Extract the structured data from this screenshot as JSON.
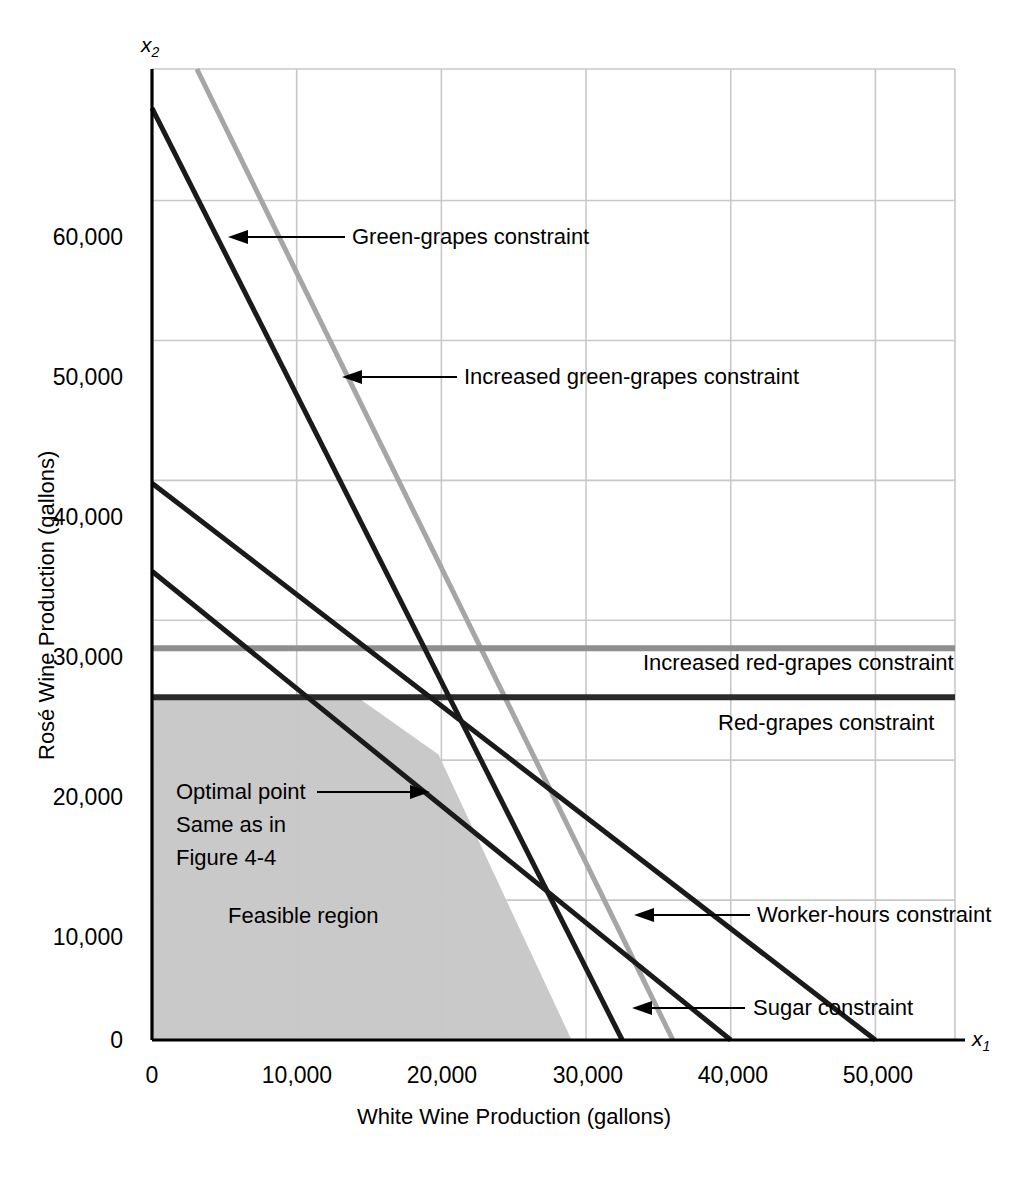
{
  "chart_data": {
    "type": "line",
    "title": "",
    "xlabel": "White Wine Production (gallons)",
    "ylabel": "Rosé Wine Production (gallons)",
    "x_axis_symbol": "x",
    "x_axis_subscript": "1",
    "y_axis_symbol": "x",
    "y_axis_subscript": "2",
    "xlim": [
      0,
      55500
    ],
    "ylim": [
      0,
      69400
    ],
    "xticks": [
      0,
      10000,
      20000,
      30000,
      40000,
      50000
    ],
    "xticklabels": [
      "0",
      "10,000",
      "20,000",
      "30,000",
      "40,000",
      "50,000"
    ],
    "yticks": [
      0,
      10000,
      20000,
      30000,
      40000,
      50000,
      60000
    ],
    "yticklabels": [
      "0",
      "10,000",
      "20,000",
      "30,000",
      "40,000",
      "50,000",
      "60,000"
    ],
    "grid": true,
    "grid_color": "#c8c8c8",
    "legend_position": "none",
    "series": [
      {
        "name": "Green-grapes constraint",
        "style": "solid-dark",
        "color": "#1a1a1a",
        "width": 5,
        "points": [
          [
            0,
            66600
          ],
          [
            32500,
            0
          ]
        ]
      },
      {
        "name": "Increased green-grapes constraint",
        "style": "solid-gray",
        "color": "#a6a6a6",
        "width": 5,
        "points": [
          [
            3100,
            69400
          ],
          [
            36000,
            0
          ]
        ]
      },
      {
        "name": "Worker-hours constraint",
        "style": "solid-dark",
        "color": "#1a1a1a",
        "width": 5,
        "points": [
          [
            0,
            39800
          ],
          [
            50000,
            0
          ]
        ]
      },
      {
        "name": "Sugar constraint",
        "style": "solid-dark",
        "color": "#1a1a1a",
        "width": 5,
        "points": [
          [
            0,
            33500
          ],
          [
            40000,
            0
          ]
        ]
      },
      {
        "name": "Red-grapes constraint",
        "style": "horizontal-dark",
        "color": "#2b2b2b",
        "width": 6,
        "points": [
          [
            0,
            24500
          ],
          [
            55500,
            24500
          ]
        ]
      },
      {
        "name": "Increased red-grapes constraint",
        "style": "horizontal-gray",
        "color": "#8f8f8f",
        "width": 6,
        "points": [
          [
            0,
            28000
          ],
          [
            55500,
            28000
          ]
        ]
      }
    ],
    "feasible_region": {
      "label": "Feasible region",
      "fill_color": "#c9c9c9",
      "vertices": [
        [
          0,
          0
        ],
        [
          0,
          24500
        ],
        [
          14200,
          24500
        ],
        [
          19800,
          20400
        ],
        [
          29000,
          0
        ]
      ]
    },
    "optimal_point": {
      "x": 20500,
      "y": 20000,
      "label_lines": [
        "Optimal point",
        "Same as in",
        "Figure 4-4"
      ]
    },
    "annotations": [
      {
        "id": "green-grapes",
        "text": "Green-grapes constraint"
      },
      {
        "id": "increased-green-grapes",
        "text": "Increased green-grapes constraint"
      },
      {
        "id": "increased-red-grapes",
        "text": "Increased red-grapes constraint"
      },
      {
        "id": "red-grapes",
        "text": "Red-grapes constraint"
      },
      {
        "id": "worker-hours",
        "text": "Worker-hours constraint"
      },
      {
        "id": "sugar",
        "text": "Sugar constraint"
      },
      {
        "id": "feasible-region",
        "text": "Feasible region"
      }
    ]
  },
  "axes": {
    "x_title": "White Wine Production (gallons)",
    "y_title": "Rosé Wine Production (gallons)",
    "x_symbol": "x",
    "x_sub": "1",
    "y_symbol": "x",
    "y_sub": "2",
    "x_ticks": [
      "0",
      "10,000",
      "20,000",
      "30,000",
      "40,000",
      "50,000"
    ],
    "y_ticks": [
      "60,000",
      "50,000",
      "40,000",
      "30,000",
      "20,000",
      "10,000",
      "0"
    ]
  },
  "labels": {
    "green_grapes": "Green-grapes constraint",
    "increased_green_grapes": "Increased green-grapes constraint",
    "increased_red_grapes": "Increased red-grapes constraint",
    "red_grapes": "Red-grapes constraint",
    "worker_hours": "Worker-hours constraint",
    "sugar": "Sugar constraint",
    "feasible_region": "Feasible region",
    "optimal_1": "Optimal point",
    "optimal_2": "Same as in",
    "optimal_3": "Figure 4-4"
  }
}
